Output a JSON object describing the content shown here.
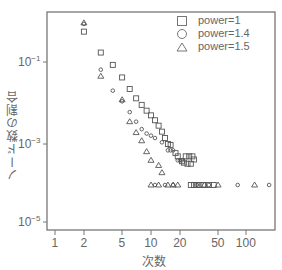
{
  "chart_data": {
    "type": "scatter",
    "title": "",
    "xlabel": "次数",
    "ylabel": "ノード数の割合",
    "xscale": "log",
    "yscale": "log",
    "xlim": [
      0.8,
      200
    ],
    "ylim": [
      6e-06,
      2
    ],
    "x_ticks": [
      "1",
      "2",
      "5",
      "10",
      "20",
      "50",
      "100"
    ],
    "y_ticks": [
      "10^-1",
      "10^-3",
      "10^-5"
    ],
    "grid": false,
    "legend_position": "upper right",
    "series": [
      {
        "name": "power=1",
        "marker": "square",
        "points": [
          [
            2,
            0.55
          ],
          [
            3,
            0.17
          ],
          [
            4,
            0.085
          ],
          [
            5,
            0.042
          ],
          [
            6,
            0.022
          ],
          [
            7,
            0.013
          ],
          [
            8,
            0.009
          ],
          [
            9,
            0.0065
          ],
          [
            10,
            0.005
          ],
          [
            11,
            0.0038
          ],
          [
            12,
            0.0028
          ],
          [
            13,
            0.002
          ],
          [
            14,
            0.0014
          ],
          [
            15,
            0.001
          ],
          [
            16,
            0.00095
          ],
          [
            18,
            0.0006
          ],
          [
            19,
            0.0005
          ],
          [
            21,
            0.00038
          ],
          [
            22,
            0.00035
          ],
          [
            23,
            0.0005
          ],
          [
            24,
            0.00033
          ],
          [
            25,
            0.0005
          ],
          [
            26,
            0.00033
          ],
          [
            27,
            0.0005
          ],
          [
            28,
            0.00042
          ],
          [
            26,
            0.0001
          ],
          [
            28,
            0.0001
          ],
          [
            30,
            0.0001
          ],
          [
            32,
            0.0001
          ],
          [
            35,
            0.0001
          ],
          [
            40,
            0.0001
          ],
          [
            45,
            0.0001
          ]
        ]
      },
      {
        "name": "power=1.4",
        "marker": "circle",
        "points": [
          [
            2,
            0.85
          ],
          [
            3,
            0.065
          ],
          [
            4,
            0.02
          ],
          [
            5,
            0.011
          ],
          [
            6,
            0.006
          ],
          [
            7,
            0.0035
          ],
          [
            8,
            0.0023
          ],
          [
            9,
            0.0018
          ],
          [
            10,
            0.0016
          ],
          [
            11,
            0.0014
          ],
          [
            13,
            0.0011
          ],
          [
            15,
            0.0007
          ],
          [
            16,
            0.0007
          ],
          [
            17,
            0.0007
          ],
          [
            19,
            0.0004
          ],
          [
            20,
            0.0004
          ],
          [
            21,
            0.0004
          ],
          [
            11,
            0.0001
          ],
          [
            14,
            0.0001
          ],
          [
            17,
            0.0001
          ],
          [
            30,
            0.0001
          ],
          [
            40,
            0.0001
          ],
          [
            80,
            0.0001
          ],
          [
            170,
            0.0001
          ]
        ]
      },
      {
        "name": "power=1.5",
        "marker": "triangle",
        "points": [
          [
            2,
            0.9
          ],
          [
            3,
            0.045
          ],
          [
            5,
            0.012
          ],
          [
            6,
            0.0035
          ],
          [
            7,
            0.0019
          ],
          [
            8,
            0.0012
          ],
          [
            9,
            0.00065
          ],
          [
            10,
            0.0004
          ],
          [
            12,
            0.0003
          ],
          [
            13,
            0.0002
          ],
          [
            10,
            0.0001
          ],
          [
            12,
            0.0001
          ],
          [
            15,
            0.0001
          ],
          [
            17,
            0.0001
          ],
          [
            19,
            0.0001
          ],
          [
            36,
            0.0001
          ],
          [
            50,
            0.0001
          ],
          [
            120,
            0.0001
          ]
        ]
      }
    ]
  },
  "axes": {
    "xlabel": "次数",
    "ylabel": "ノード数の割合",
    "x_ticks": [
      {
        "label": "1",
        "px": 55
      },
      {
        "label": "2",
        "px": 84
      },
      {
        "label": "5",
        "px": 122
      },
      {
        "label": "10",
        "px": 151
      },
      {
        "label": "20",
        "px": 180
      },
      {
        "label": "50",
        "px": 218
      },
      {
        "label": "100",
        "px": 246
      }
    ],
    "y_ticks": [
      {
        "base": "10",
        "exp": "−1",
        "px": 62
      },
      {
        "base": "10",
        "exp": "−3",
        "px": 144
      },
      {
        "base": "10",
        "exp": "−5",
        "px": 222
      }
    ]
  },
  "legend": {
    "items": [
      {
        "label": "power=1",
        "marker": "square"
      },
      {
        "label": "power=1.4",
        "marker": "circle"
      },
      {
        "label": "power=1.5",
        "marker": "triangle"
      }
    ]
  },
  "colors": {
    "axis": "#666666",
    "marker": "#555555",
    "text": "#666666"
  }
}
